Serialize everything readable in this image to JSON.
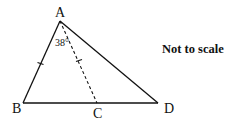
{
  "diagram": {
    "points": {
      "A": {
        "label": "A",
        "x": 60,
        "y": 21
      },
      "B": {
        "label": "B",
        "x": 23,
        "y": 103
      },
      "C": {
        "label": "C",
        "x": 97,
        "y": 103
      },
      "D": {
        "label": "D",
        "x": 158,
        "y": 103
      }
    },
    "segments": [
      {
        "from": "A",
        "to": "B",
        "style": "solid",
        "tick_marks": 1
      },
      {
        "from": "A",
        "to": "D",
        "style": "solid",
        "tick_marks": 0
      },
      {
        "from": "B",
        "to": "D",
        "style": "solid",
        "tick_marks": 0
      },
      {
        "from": "A",
        "to": "C",
        "style": "dashed",
        "tick_marks": 1
      }
    ],
    "angle": {
      "vertex": "A",
      "between": [
        "B",
        "C"
      ],
      "label": "38°"
    },
    "note": "Not to scale"
  }
}
